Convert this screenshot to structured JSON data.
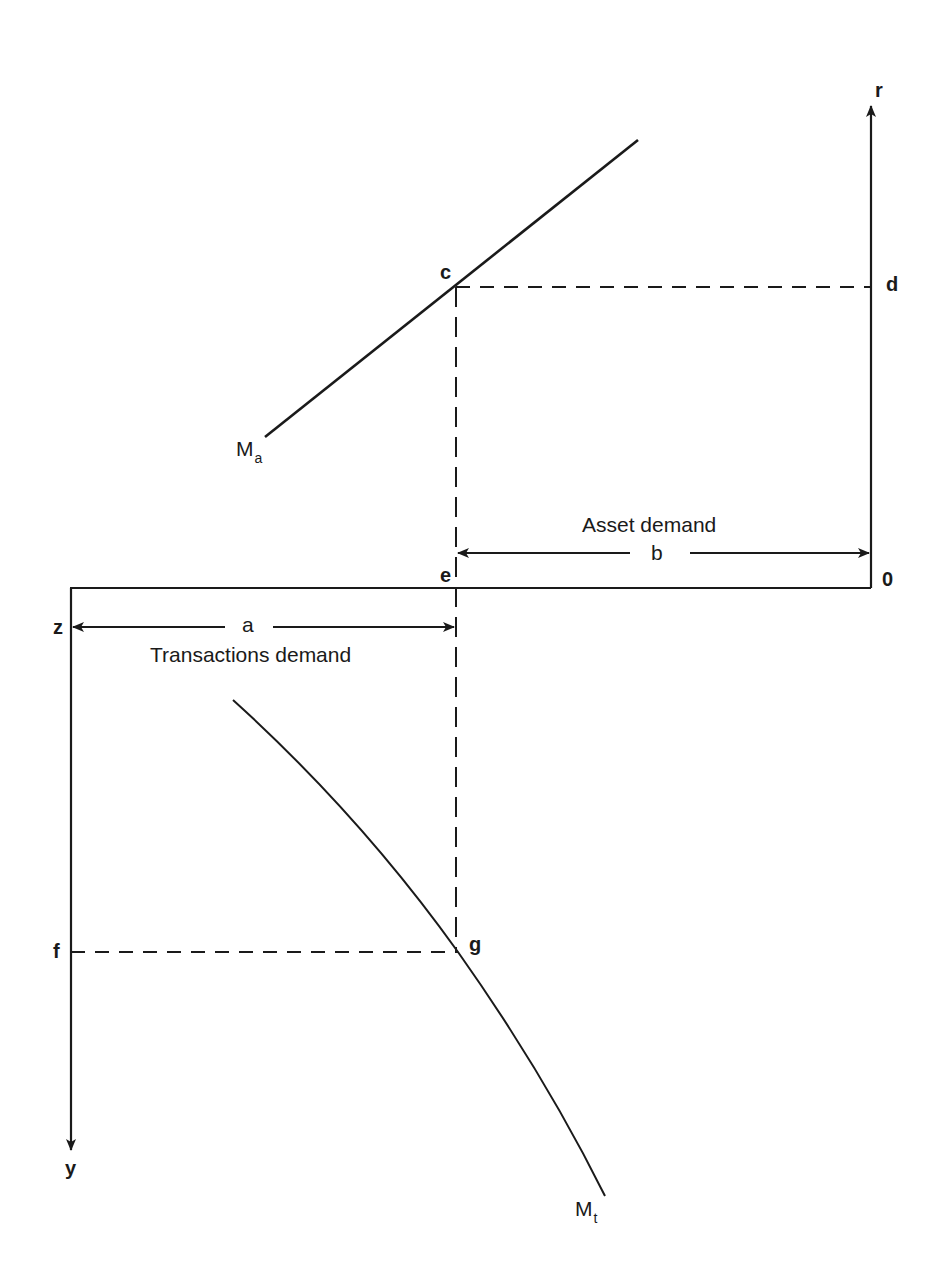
{
  "diagram": {
    "title": "",
    "axes": {
      "interest_rate_axis": "r",
      "income_axis": "y",
      "origin_right": "0",
      "origin_left": "z"
    },
    "points": {
      "c": "c",
      "d": "d",
      "e": "e",
      "f": "f",
      "g": "g"
    },
    "curves": {
      "asset_demand_curve": {
        "label": "M",
        "subscript": "a"
      },
      "transactions_demand_curve": {
        "label": "M",
        "subscript": "t"
      }
    },
    "spans": {
      "asset": {
        "letter": "b",
        "caption": "Asset demand"
      },
      "transactions": {
        "letter": "a",
        "caption": "Transactions demand"
      }
    },
    "colors": {
      "ink": "#1a1a1a",
      "background": "#ffffff"
    }
  }
}
